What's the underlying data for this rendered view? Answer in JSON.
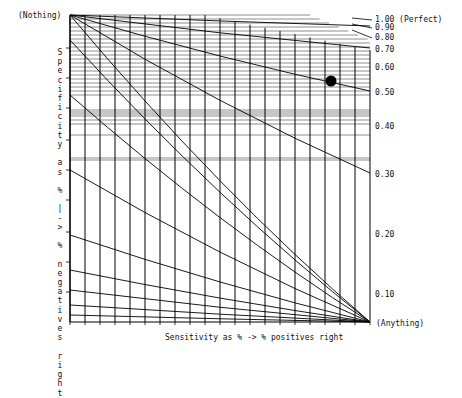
{
  "chart_data": {
    "type": "line",
    "title": "",
    "xlabel": "Sensitivity as % -> % positives right",
    "ylabel": "Specificity as % |-> % negatives right",
    "top_left_label": "(Nothing)",
    "bottom_right_label": "(Anything)",
    "curve_labels": [
      "1.00 (Perfect)",
      "0.90",
      "0.80",
      "0.70",
      "0.60",
      "0.50",
      "0.40",
      "0.30",
      "0.20",
      "0.10"
    ],
    "curve_values": [
      1.0,
      0.9,
      0.8,
      0.7,
      0.6,
      0.5,
      0.4,
      0.3,
      0.2,
      0.1
    ],
    "grid": true,
    "vertical_gridlines": 20,
    "marker": {
      "shape": "filled-circle",
      "x_frac": 0.87,
      "y_frac": 0.215,
      "near_curve": "0.50-0.60"
    },
    "colors": {
      "lines": "#000000",
      "background": "#ffffff",
      "marker": "#000000"
    }
  }
}
